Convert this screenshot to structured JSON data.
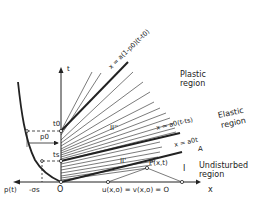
{
  "figure": {
    "type": "characteristics diagram (x-t plane)",
    "axes": {
      "x_label": "x",
      "t_label": "t",
      "origin_label": "O",
      "left_axis_label": "p(t)",
      "left_axis_value": "-σs"
    },
    "time_marks": {
      "t0": "t0",
      "ts": "ts",
      "p0": "p0"
    },
    "lines": {
      "plastic_front": "x = a(1-p0)(t-t0)",
      "elastic_front": "x = a0(t-ts)",
      "wave_front": "x = a0t"
    },
    "regions": {
      "plastic": [
        "Plastic",
        "region"
      ],
      "elastic": [
        "Elastic",
        "region"
      ],
      "undisturbed": [
        "Undisturbed",
        "region"
      ],
      "region_I": "I",
      "region_II_prime": "II'",
      "region_II_double_prime": "II''"
    },
    "point_labels": {
      "P": "P(x,t)",
      "A": "A"
    },
    "boundary_condition": "u(x,o) = v(x,o) = O",
    "colors": {
      "ink": "#222222",
      "background": "#ffffff"
    }
  }
}
